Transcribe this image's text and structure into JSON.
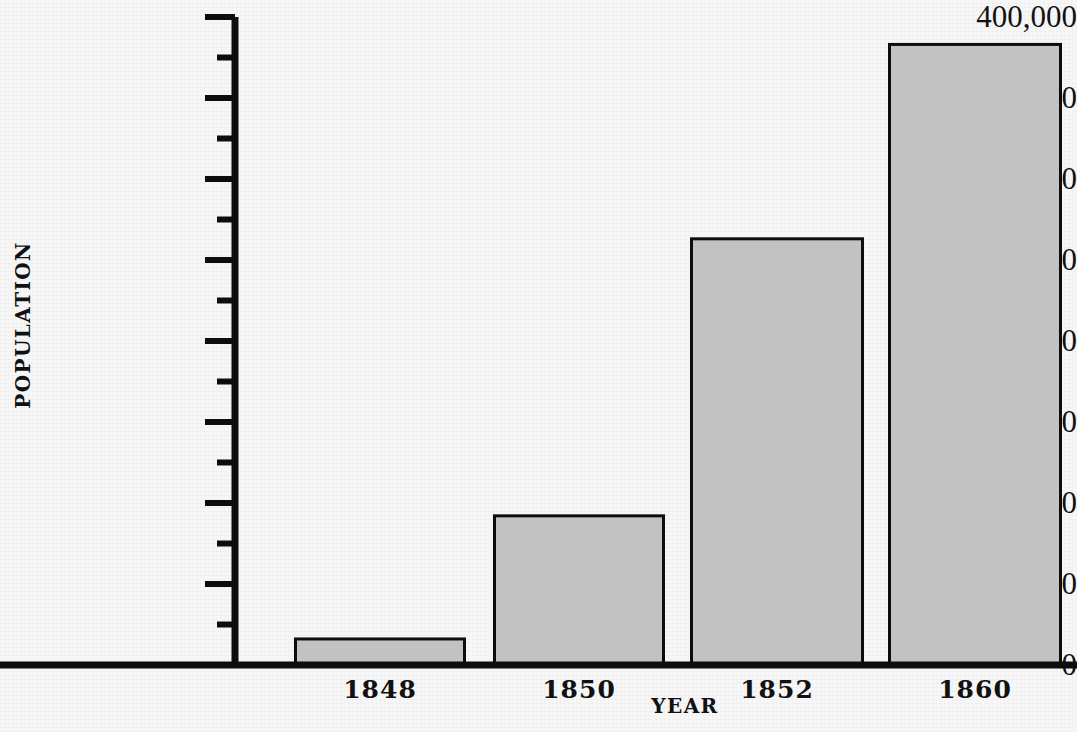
{
  "chart_data": {
    "type": "bar",
    "title": "",
    "subtitle": "",
    "xlabel": "YEAR",
    "ylabel": "POPULATION",
    "categories": [
      "1848",
      "1850",
      "1852",
      "1860"
    ],
    "values": [
      17000,
      93000,
      264000,
      384000
    ],
    "series": [
      {
        "name": "Population",
        "values": [
          17000,
          93000,
          264000,
          384000
        ]
      }
    ],
    "ylim": [
      0,
      400000
    ],
    "xlim_note": "categorical",
    "y_tick_labels": [
      "0",
      "50,000",
      "100,000",
      "150,000",
      "200,000",
      "250,000",
      "300,000",
      "350,000",
      "400,000"
    ],
    "y_tick_values": [
      0,
      50000,
      100000,
      150000,
      200000,
      250000,
      300000,
      350000,
      400000
    ],
    "y_minor_tick_values": [
      25000,
      75000,
      125000,
      175000,
      225000,
      275000,
      325000,
      375000
    ],
    "grid": false,
    "legend": false,
    "legend_position": "none",
    "annotations": [],
    "colors": {
      "bar_fill": "#c2c2c2",
      "bar_stroke": "#0d0d0d",
      "axis": "#0d0d0d",
      "text": "#111111",
      "background": "#f7f7f7"
    }
  },
  "axes": {
    "y_title": "POPULATION",
    "x_title": "YEAR"
  }
}
